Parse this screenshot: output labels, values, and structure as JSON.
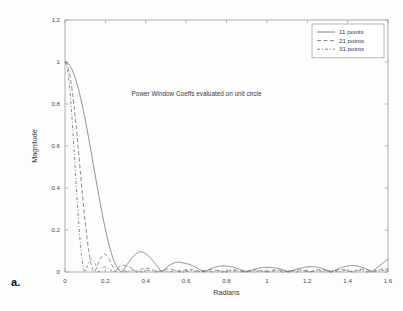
{
  "figure": {
    "panel_label": "a.",
    "background_color": "#fdfdfd",
    "axis_color": "#9a9a9a",
    "line_color": "#5c5c5c",
    "text_color": "#3b3b3b"
  },
  "chart_data": {
    "type": "line",
    "title": "",
    "annotation": "Power Window Coeffs evaluated on unit circle",
    "annotation_xy": [
      0.33,
      0.84
    ],
    "xlabel": "Radians",
    "ylabel": "Magnitude",
    "xlim": [
      0,
      1.6
    ],
    "ylim": [
      0,
      1.2
    ],
    "xticks": [
      0,
      0.2,
      0.4,
      0.6,
      0.8,
      1,
      1.2,
      1.4,
      1.6
    ],
    "xticklabels": [
      "0",
      "0.2",
      "0.4",
      "0.6",
      "0.8",
      "1",
      "1.2",
      "1.4",
      "1.6"
    ],
    "yticks": [
      0,
      0.2,
      0.4,
      0.6,
      0.8,
      1,
      1.2
    ],
    "yticklabels": [
      "0",
      "0.2",
      "0.4",
      "0.6",
      "0.8",
      "1",
      "1.2"
    ],
    "grid": false,
    "legend_position": "upper right",
    "legend_entries": [
      "11 points",
      "21 points",
      "31 points"
    ],
    "series": [
      {
        "name": "11 points",
        "n_points": 11,
        "style": "solid",
        "dash": "none",
        "main_lobe_null": 0.285,
        "sidelobe_peaks": [
          {
            "x": 0.37,
            "y": 0.098
          },
          {
            "x": 0.59,
            "y": 0.042
          },
          {
            "x": 0.8,
            "y": 0.028
          },
          {
            "x": 1.0,
            "y": 0.022
          },
          {
            "x": 1.21,
            "y": 0.025
          },
          {
            "x": 1.42,
            "y": 0.031
          }
        ],
        "nulls": [
          0.285,
          0.48,
          0.69,
          0.9,
          1.11,
          1.32,
          1.52
        ],
        "edge_value_at_xmax": 0.062
      },
      {
        "name": "21 points",
        "n_points": 21,
        "style": "dashed",
        "dash": "4,2.5",
        "main_lobe_null": 0.148,
        "sidelobe_peaks": [
          {
            "x": 0.195,
            "y": 0.086
          },
          {
            "x": 0.3,
            "y": 0.03
          },
          {
            "x": 0.41,
            "y": 0.018
          },
          {
            "x": 0.52,
            "y": 0.014
          },
          {
            "x": 0.62,
            "y": 0.012
          },
          {
            "x": 0.73,
            "y": 0.011
          },
          {
            "x": 0.84,
            "y": 0.01
          },
          {
            "x": 0.94,
            "y": 0.01
          },
          {
            "x": 1.05,
            "y": 0.01
          },
          {
            "x": 1.16,
            "y": 0.01
          },
          {
            "x": 1.26,
            "y": 0.011
          },
          {
            "x": 1.37,
            "y": 0.012
          },
          {
            "x": 1.48,
            "y": 0.013
          }
        ],
        "nulls": [
          0.148,
          0.25,
          0.355,
          0.46,
          0.57,
          0.675,
          0.78,
          0.89,
          0.995,
          1.1,
          1.21,
          1.315,
          1.42,
          1.53
        ],
        "edge_value_at_xmax": 0.014
      },
      {
        "name": "31 points",
        "n_points": 31,
        "style": "dash-dot",
        "dash": "3,2,1,2",
        "main_lobe_null": 0.1,
        "sidelobe_peaks": [
          {
            "x": 0.132,
            "y": 0.062
          },
          {
            "x": 0.2,
            "y": 0.023
          },
          {
            "x": 0.27,
            "y": 0.013
          },
          {
            "x": 0.34,
            "y": 0.009
          },
          {
            "x": 0.41,
            "y": 0.008
          },
          {
            "x": 0.48,
            "y": 0.007
          },
          {
            "x": 0.56,
            "y": 0.007
          },
          {
            "x": 0.63,
            "y": 0.006
          },
          {
            "x": 0.7,
            "y": 0.006
          },
          {
            "x": 0.77,
            "y": 0.006
          },
          {
            "x": 0.84,
            "y": 0.006
          },
          {
            "x": 0.91,
            "y": 0.006
          },
          {
            "x": 0.98,
            "y": 0.006
          },
          {
            "x": 1.05,
            "y": 0.006
          },
          {
            "x": 1.13,
            "y": 0.006
          },
          {
            "x": 1.2,
            "y": 0.006
          },
          {
            "x": 1.27,
            "y": 0.007
          },
          {
            "x": 1.34,
            "y": 0.007
          },
          {
            "x": 1.41,
            "y": 0.008
          },
          {
            "x": 1.48,
            "y": 0.008
          }
        ],
        "nulls": [
          0.1,
          0.168,
          0.238,
          0.308,
          0.378,
          0.448,
          0.518,
          0.588,
          0.658,
          0.728,
          0.798,
          0.868,
          0.938,
          1.008,
          1.078,
          1.148,
          1.218,
          1.288,
          1.358,
          1.428,
          1.498
        ],
        "edge_value_at_xmax": 0.009
      }
    ],
    "peak_value": 1.0,
    "peak_x": 0.0
  }
}
